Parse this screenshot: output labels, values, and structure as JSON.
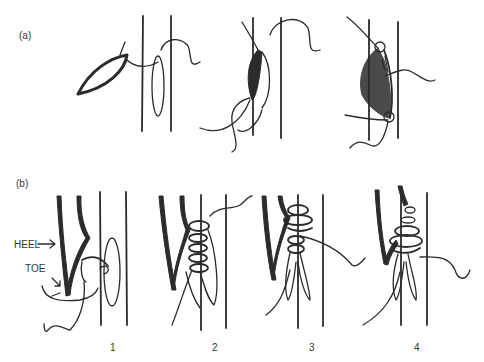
{
  "figure": {
    "panel_a": {
      "label": "(a)",
      "steps": 3
    },
    "panel_b": {
      "label": "(b)",
      "annotations": {
        "heel": "HEEL",
        "toe": "TOE"
      },
      "step_numbers": [
        "1",
        "2",
        "3",
        "4"
      ]
    }
  }
}
